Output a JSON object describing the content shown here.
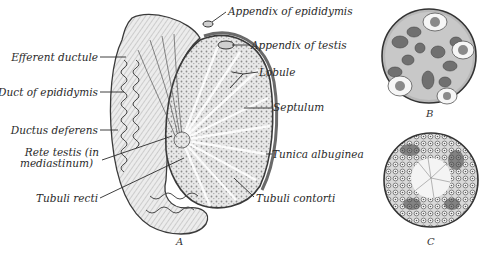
{
  "figure": {
    "panels": [
      {
        "id": "A",
        "letter": "A",
        "description": "Vertical section of testis and epididymis"
      },
      {
        "id": "B",
        "letter": "B",
        "description": "Transverse section of seminiferous tubule"
      },
      {
        "id": "C",
        "letter": "C",
        "description": "Transverse section of seminiferous tubule"
      }
    ]
  },
  "labels": {
    "appendix_of_epididymis": "Appendix of epididymis",
    "appendix_of_testis": "Appendix of testis",
    "efferent_ductule": "Efferent ductule",
    "lobule": "Lobule",
    "duct_of_epididymis": "Duct of epididymis",
    "septulum": "Septulum",
    "ductus_deferens": "Ductus deferens",
    "rete_testis_line1": "Rete testis (in",
    "rete_testis_line2": "mediastinum)",
    "tunica_albuginea": "Tunica albuginea",
    "tubuli_recti": "Tubuli recti",
    "tubuli_contorti": "Tubuli contorti"
  },
  "colors": {
    "ink": "#2a2a2a",
    "tissue_fill": "#e4e4e4",
    "tissue_dark": "#8a8a8a",
    "background": "#ffffff"
  }
}
